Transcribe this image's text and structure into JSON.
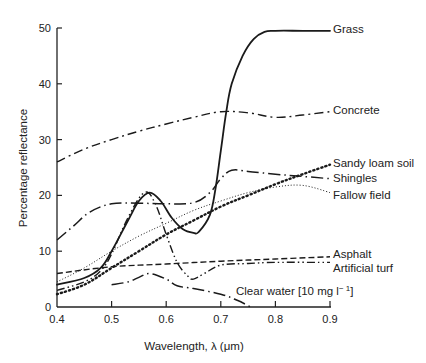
{
  "chart_data": {
    "type": "line",
    "title": "",
    "xlabel": "Wavelength, λ (μm)",
    "ylabel": "Percentage reflectance",
    "xlim": [
      0.4,
      0.9
    ],
    "ylim": [
      0,
      50
    ],
    "xticks": [
      0.4,
      0.5,
      0.6,
      0.7,
      0.8,
      0.9
    ],
    "xtick_labels": [
      "0.4",
      "0.5",
      "0.6",
      "0.7",
      "0.8",
      "0.9"
    ],
    "yticks": [
      0,
      10,
      20,
      30,
      40,
      50
    ],
    "ytick_labels": [
      "0",
      "10",
      "20",
      "30",
      "40",
      "50"
    ],
    "grid": false,
    "legend_position": "inline-right",
    "series": [
      {
        "name": "Grass",
        "style": "solid",
        "label_at": [
          0.9,
          49.5
        ],
        "x": [
          0.4,
          0.45,
          0.48,
          0.5,
          0.53,
          0.55,
          0.57,
          0.59,
          0.61,
          0.63,
          0.65,
          0.66,
          0.68,
          0.69,
          0.7,
          0.71,
          0.72,
          0.74,
          0.76,
          0.78,
          0.8,
          0.85,
          0.9
        ],
        "values": [
          4,
          5.2,
          7,
          10,
          15.5,
          19,
          20.5,
          19,
          16,
          14,
          13.3,
          13.5,
          16.5,
          21,
          28,
          35,
          40,
          45,
          48,
          49.3,
          49.5,
          49.5,
          49.5
        ]
      },
      {
        "name": "Concrete",
        "style": "dashdot",
        "label_at": [
          0.9,
          35
        ],
        "x": [
          0.4,
          0.45,
          0.5,
          0.55,
          0.6,
          0.65,
          0.7,
          0.75,
          0.8,
          0.85,
          0.9
        ],
        "values": [
          26,
          28.3,
          30,
          31.5,
          32.8,
          34,
          35,
          34.8,
          34,
          34.4,
          35
        ]
      },
      {
        "name": "Sandy loam soil",
        "style": "dotted-heavy",
        "label_at": [
          0.9,
          25.5
        ],
        "x": [
          0.4,
          0.45,
          0.5,
          0.55,
          0.6,
          0.65,
          0.7,
          0.75,
          0.8,
          0.85,
          0.9
        ],
        "values": [
          2.3,
          4,
          7,
          10,
          13,
          15.5,
          18,
          20,
          22,
          23.8,
          25.5
        ]
      },
      {
        "name": "Shingles",
        "style": "longdash-dot",
        "label_at": [
          0.9,
          23
        ],
        "x": [
          0.4,
          0.43,
          0.46,
          0.5,
          0.55,
          0.6,
          0.65,
          0.68,
          0.7,
          0.72,
          0.75,
          0.8,
          0.85,
          0.9
        ],
        "values": [
          12,
          14.5,
          17,
          18.5,
          18.6,
          18.5,
          18.7,
          20.5,
          23,
          24.5,
          24.3,
          23.8,
          23.4,
          23
        ]
      },
      {
        "name": "Fallow field",
        "style": "dotted-fine",
        "label_at": [
          0.9,
          20.5
        ],
        "x": [
          0.4,
          0.45,
          0.5,
          0.55,
          0.6,
          0.65,
          0.7,
          0.75,
          0.8,
          0.85,
          0.9
        ],
        "values": [
          4.5,
          7,
          10,
          12.7,
          15,
          17.3,
          19,
          20.5,
          21.5,
          21.8,
          20.5
        ]
      },
      {
        "name": "Asphalt",
        "style": "dashed",
        "label_at": [
          0.9,
          9
        ],
        "x": [
          0.4,
          0.5,
          0.6,
          0.7,
          0.8,
          0.9
        ],
        "values": [
          6,
          7.2,
          7.7,
          8.2,
          8.6,
          9
        ]
      },
      {
        "name": "Artificial turf",
        "style": "dashdot-mixed",
        "label_at": [
          0.9,
          8
        ],
        "x": [
          0.4,
          0.45,
          0.48,
          0.5,
          0.53,
          0.56,
          0.58,
          0.6,
          0.62,
          0.64,
          0.65,
          0.67,
          0.7,
          0.75,
          0.8,
          0.9
        ],
        "values": [
          3,
          4.5,
          6.5,
          9.5,
          16,
          20.5,
          18.5,
          13,
          8,
          5.5,
          5,
          6,
          7.5,
          7.8,
          8,
          8
        ]
      },
      {
        "name": "Clear water [10 mg l⁻¹]",
        "style": "longdash-dot",
        "label_at": [
          0.72,
          2.5
        ],
        "x": [
          0.5,
          0.53,
          0.55,
          0.57,
          0.6,
          0.62,
          0.65,
          0.7,
          0.73,
          0.755
        ],
        "values": [
          4,
          4.5,
          5.3,
          6,
          5,
          3.8,
          3.3,
          2.3,
          1.2,
          0
        ]
      }
    ],
    "annotations": []
  },
  "labels": {
    "grass": "Grass",
    "concrete": "Concrete",
    "sandy_loam_soil": "Sandy loam soil",
    "shingles": "Shingles",
    "fallow_field": "Fallow field",
    "asphalt": "Asphalt",
    "artificial_turf": "Artificial turf",
    "clear_water": "Clear water [10 mg l",
    "clear_water_sup": "− 1",
    "clear_water_close": "]"
  }
}
